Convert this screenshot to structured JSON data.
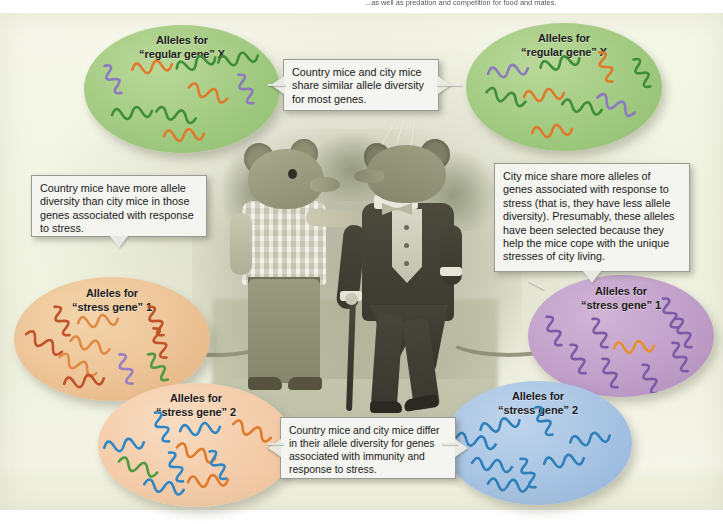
{
  "figure": {
    "top_caption_left": "",
    "top_caption_right": "...as well as predation and competition for food and mates."
  },
  "ellipses": [
    {
      "id": "green-left",
      "label_line1": "Alleles for",
      "label_line2": "“regular gene” X",
      "color": "#a6cd86",
      "group": "country",
      "gene": "regular gene X",
      "allele_colors": [
        "purple",
        "orange",
        "green",
        "green",
        "orange",
        "purple",
        "green",
        "green",
        "orange"
      ]
    },
    {
      "id": "green-right",
      "label_line1": "Alleles for",
      "label_line2": "“regular gene” X",
      "color": "#a6cd86",
      "group": "city",
      "gene": "regular gene X",
      "allele_colors": [
        "purple",
        "green",
        "orange",
        "green",
        "green",
        "orange",
        "green",
        "purple",
        "orange"
      ]
    },
    {
      "id": "orange-stress1",
      "label_line1": "Alleles for",
      "label_line2": "“stress gene” 1",
      "color": "#eec69a",
      "group": "country",
      "gene": "stress gene 1",
      "allele_colors": [
        "orange",
        "red",
        "orange",
        "red",
        "orange",
        "red",
        "orange",
        "purple",
        "green",
        "red"
      ]
    },
    {
      "id": "peach-stress2",
      "label_line1": "Alleles for",
      "label_line2": "“stress gene” 2",
      "color": "#f4cdab",
      "group": "country",
      "gene": "stress gene 2",
      "allele_colors": [
        "blue",
        "blue",
        "blue",
        "orange",
        "green",
        "blue",
        "orange",
        "blue",
        "blue",
        "orange"
      ]
    },
    {
      "id": "purple-stress1",
      "label_line1": "Alleles for",
      "label_line2": "“stress gene” 1",
      "color": "#c2a2cb",
      "group": "city",
      "gene": "stress gene 1",
      "allele_colors": [
        "purple",
        "purple",
        "purple",
        "orange",
        "purple",
        "purple",
        "purple",
        "purple",
        "purple"
      ]
    },
    {
      "id": "blue-stress2",
      "label_line1": "Alleles for",
      "label_line2": "“stress gene” 2",
      "color": "#a9c5e4",
      "group": "city",
      "gene": "stress gene 2",
      "allele_colors": [
        "blue",
        "blue",
        "blue",
        "blue",
        "blue",
        "blue",
        "blue",
        "blue"
      ]
    }
  ],
  "callouts": {
    "top_center": "Country mice and city mice share similar allele diversity for most genes.",
    "left": "Country mice have more allele diversity than city mice in those genes associated with response to stress.",
    "right": "City mice share more alleles of genes associated with response to stress (that is, they have less allele diversity). Presumably, these alleles have been selected because they help the mice cope with the unique stresses of city living.",
    "bottom_center": "Country mice and city mice differ in their allele diversity for genes associated with immunity and response to stress."
  },
  "scene": {
    "country_mouse": "country mouse in plaid shirt pointing",
    "city_mouse": "city mouse in tuxedo with cane"
  }
}
